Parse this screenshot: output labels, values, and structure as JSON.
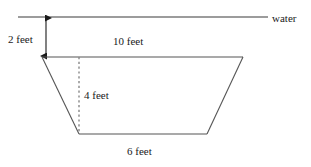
{
  "figure": {
    "labels": {
      "water": "water",
      "depth_to_top": "2 feet",
      "top_width": "10 feet",
      "height": "4 feet",
      "bottom_width": "6 feet"
    },
    "colors": {
      "line": "#555555",
      "water_line": "#3a3a3a",
      "dashed_line": "#777777",
      "text": "#1a1a1a",
      "background": "#ffffff"
    },
    "geometry": {
      "water_line": {
        "x1": 18,
        "y1": 17,
        "x2": 268,
        "y2": 17
      },
      "depth_arrow": {
        "x": 46,
        "y1": 17,
        "y2": 57
      },
      "trapezoid": {
        "top_left": {
          "x": 42,
          "y": 57
        },
        "top_right": {
          "x": 243,
          "y": 57
        },
        "bottom_right": {
          "x": 207,
          "y": 134
        },
        "bottom_left": {
          "x": 79,
          "y": 134
        }
      },
      "height_dashed": {
        "x": 79,
        "y1": 57,
        "y2": 134
      }
    },
    "measurements": {
      "depth_to_top_ft": 2,
      "top_width_ft": 10,
      "height_ft": 4,
      "bottom_width_ft": 6
    }
  }
}
